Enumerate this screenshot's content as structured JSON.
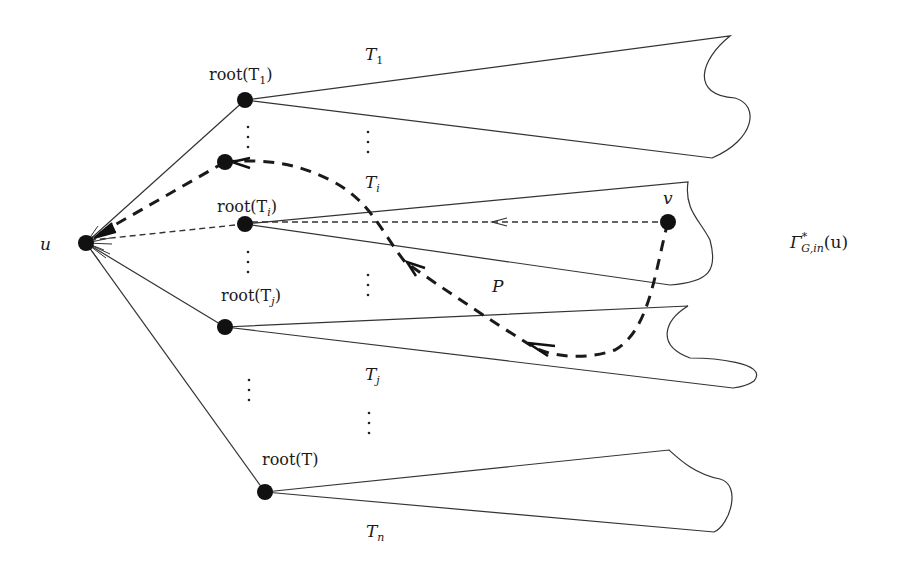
{
  "diagram": {
    "type": "tree-decomposition-figure",
    "nodes": {
      "u": {
        "label": "u"
      },
      "v": {
        "label": "v"
      },
      "root_T1": {
        "label": "root(T",
        "sub": "1",
        "close": ")"
      },
      "root_Ti": {
        "label": "root(T",
        "sub": "i",
        "close": ")"
      },
      "root_Tj": {
        "label": "root(T",
        "sub": "j",
        "close": ")"
      },
      "root_T": {
        "label": "root(T)"
      }
    },
    "trees": {
      "T1": {
        "label": "T",
        "sub": "1"
      },
      "Ti": {
        "label": "T",
        "sub": "i"
      },
      "Tj": {
        "label": "T",
        "sub": "j"
      },
      "Tn": {
        "label": "T",
        "sub": "n"
      }
    },
    "path": {
      "label": "P"
    },
    "region": {
      "label": "Γ",
      "sup": "*",
      "sub": "G,in",
      "arg": "(u)"
    }
  }
}
